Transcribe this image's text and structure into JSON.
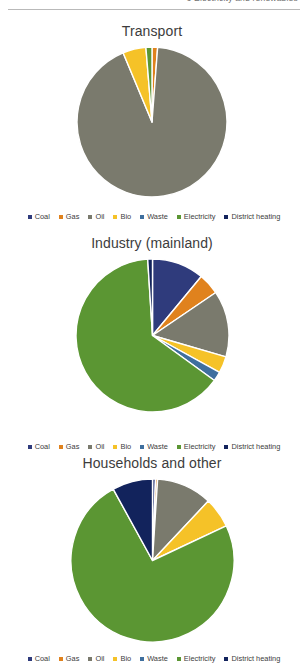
{
  "header": {
    "running_text": "6 Electricity and renewables"
  },
  "palette": {
    "coal": "#2f3b7c",
    "gas": "#e0821d",
    "oil": "#7a7a6d",
    "bio": "#f5c228",
    "waste": "#3f6f9e",
    "electricity": "#5b9633",
    "district_heating": "#12235c",
    "slice_border": "#ffffff",
    "title_color": "#3c3c3c"
  },
  "legend": {
    "items": [
      {
        "label": "Coal",
        "color_key": "coal",
        "swatch": "square-marker"
      },
      {
        "label": "Gas",
        "color_key": "gas",
        "swatch": "square-marker"
      },
      {
        "label": "Oil",
        "color_key": "oil",
        "swatch": "square-marker"
      },
      {
        "label": "Bio",
        "color_key": "bio",
        "swatch": "square-marker"
      },
      {
        "label": "Waste",
        "color_key": "waste",
        "swatch": "square-marker"
      },
      {
        "label": "Electricity",
        "color_key": "electricity",
        "swatch": "square-marker"
      },
      {
        "label": "District heating",
        "color_key": "district_heating",
        "swatch": "square-marker"
      }
    ]
  },
  "chart_data": [
    {
      "type": "pie",
      "title": "Transport",
      "id": "transport",
      "legend_position": "bottom",
      "categories": [
        "Coal",
        "Gas",
        "Oil",
        "Bio",
        "Waste",
        "Electricity",
        "District heating"
      ],
      "values": [
        0,
        1.2,
        92.5,
        5.0,
        0,
        1.3,
        0
      ],
      "unit": "%",
      "start_angle": 0,
      "direction": "clockwise"
    },
    {
      "type": "pie",
      "title": "Industry (mainland)",
      "id": "industry-mainland",
      "legend_position": "bottom",
      "categories": [
        "Coal",
        "Gas",
        "Oil",
        "Bio",
        "Waste",
        "Electricity",
        "District heating"
      ],
      "values": [
        11.0,
        4.5,
        14.0,
        3.5,
        2.0,
        64.0,
        1.0
      ],
      "unit": "%",
      "start_angle": 0,
      "direction": "clockwise"
    },
    {
      "type": "pie",
      "title": "Households and other",
      "id": "households-and-other",
      "legend_position": "bottom",
      "categories": [
        "Coal",
        "Gas",
        "Oil",
        "Bio",
        "Waste",
        "Electricity",
        "District heating"
      ],
      "values": [
        0.6,
        0.4,
        11.0,
        6.0,
        0,
        74.0,
        8.0
      ],
      "unit": "%",
      "start_angle": 0,
      "direction": "clockwise"
    }
  ],
  "layout": {
    "charts": [
      {
        "top": 22,
        "pie_size": 152,
        "legend_top": 212
      },
      {
        "top": 234,
        "pie_size": 155,
        "legend_top": 442
      },
      {
        "top": 454,
        "pie_size": 165,
        "legend_top": 654
      }
    ]
  }
}
